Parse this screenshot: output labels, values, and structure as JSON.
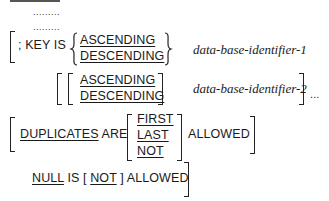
{
  "syntax": {
    "top_rule": "",
    "ellipsis_rows": [
      ".........",
      "........."
    ],
    "key_clause": {
      "prefix": "; KEY IS",
      "order_options": [
        "ASCENDING",
        "DESCENDING"
      ],
      "identifier": "data-base-identifier-1"
    },
    "repeat_clause": {
      "order_options": [
        "ASCENDING",
        "DESCENDING"
      ],
      "identifier": "data-base-identifier-2",
      "repeat_marker": "..."
    },
    "duplicates_clause": {
      "keyword": "DUPLICATES",
      "are": "ARE",
      "options": [
        "FIRST",
        "LAST",
        "NOT"
      ],
      "allowed": "ALLOWED"
    },
    "null_clause": {
      "null": "NULL",
      "is": "IS",
      "open_bracket": "[",
      "not": "NOT",
      "close_bracket": "]",
      "allowed": "ALLOWED"
    }
  }
}
